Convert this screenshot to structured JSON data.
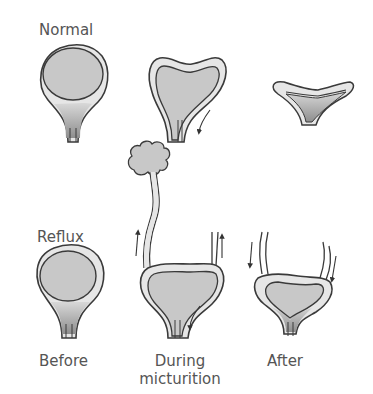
{
  "rows": [
    {
      "label": "Normal"
    },
    {
      "label": "Reflux"
    }
  ],
  "columns": [
    {
      "label": "Before"
    },
    {
      "label_line1": "During",
      "label_line2": "micturition"
    },
    {
      "label": "After"
    }
  ],
  "colors": {
    "outline": "#3a3a3a",
    "wall": "#e6e6e6",
    "lumen": "#c8c8c8",
    "neck_shade": "#9a9a9a",
    "text": "#555555"
  }
}
